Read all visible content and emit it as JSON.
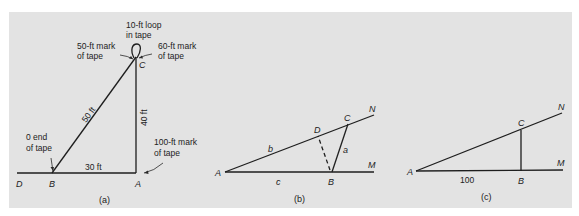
{
  "figure": {
    "background_color": "#e3e3e3",
    "line_color": "#1e1e1e",
    "panels": [
      {
        "id": "a",
        "caption": "(a)",
        "points": {
          "D": "D",
          "B": "B",
          "A": "A",
          "C": "C"
        },
        "lengths": {
          "BC": "50 ft",
          "CA": "40 ft",
          "BA": "30 ft"
        },
        "annotations": {
          "loop_line1": "10-ft loop",
          "loop_line2": "in tape",
          "mark50_line1": "50-ft mark",
          "mark50_line2": "of tape",
          "mark60_line1": "60-ft mark",
          "mark60_line2": "of tape",
          "zero_line1": "0 end",
          "zero_line2": "of tape",
          "mark100_line1": "100-ft mark",
          "mark100_line2": "of tape"
        }
      },
      {
        "id": "b",
        "caption": "(b)",
        "points": {
          "A": "A",
          "B": "B",
          "C": "C",
          "D": "D",
          "M": "M",
          "N": "N"
        },
        "sides": {
          "a": "a",
          "b": "b",
          "c": "c"
        }
      },
      {
        "id": "c",
        "caption": "(c)",
        "points": {
          "A": "A",
          "B": "B",
          "C": "C",
          "M": "M",
          "N": "N"
        },
        "lengths": {
          "AB": "100"
        }
      }
    ]
  }
}
